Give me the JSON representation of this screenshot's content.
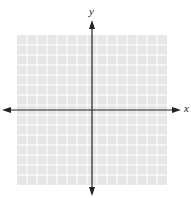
{
  "diagram": {
    "type": "coordinate-plane",
    "x_axis_label": "x",
    "y_axis_label": "y",
    "grid": {
      "columns": 15,
      "rows": 15,
      "left": 17,
      "top": 35,
      "width": 150,
      "height": 150,
      "fill_color": "#e6e6e6",
      "line_color": "#ffffff"
    },
    "origin": {
      "x": 92,
      "y": 110
    },
    "axis_color": "#222222",
    "x_axis": {
      "x1": 2,
      "x2": 181
    },
    "y_axis": {
      "y1": 20,
      "y2": 196
    }
  }
}
